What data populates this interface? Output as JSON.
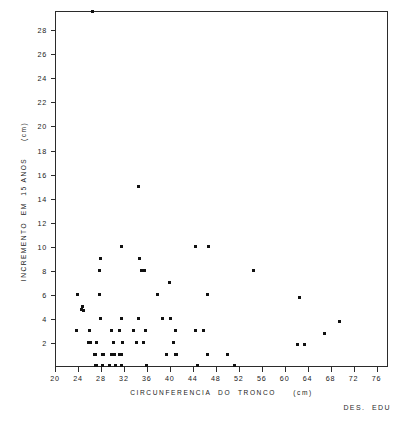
{
  "chart_data": {
    "type": "scatter",
    "title": "",
    "xlabel": "CIRCUNFERENCIA  DO  TRONCO     (cm)",
    "ylabel": "INCREMENTO  EM  15 ANOS     (cm)",
    "xlim": [
      20,
      78
    ],
    "ylim": [
      0,
      29.6
    ],
    "xticks": [
      20,
      24,
      28,
      32,
      36,
      40,
      44,
      48,
      52,
      56,
      60,
      64,
      68,
      72,
      76
    ],
    "yticks": [
      2,
      4,
      6,
      8,
      10,
      12,
      14,
      16,
      18,
      20,
      22,
      24,
      26,
      28
    ],
    "xtick_labels": [
      "20",
      "24",
      "28",
      "32",
      "36",
      "40",
      "44",
      "48",
      "52",
      "56",
      "60",
      "64",
      "68",
      "72",
      "76"
    ],
    "ytick_labels": [
      "2",
      "4",
      "6",
      "8",
      "10",
      "12",
      "14",
      "16",
      "18",
      "20",
      "22",
      "24",
      "26",
      "28"
    ],
    "grid": false,
    "legend": null,
    "marker": "square",
    "marker_color": "#111111",
    "frame_color": "#2b2b2b",
    "annotation": "DES.  EDU",
    "points": [
      [
        26.5,
        29.6
      ],
      [
        34.5,
        15.0
      ],
      [
        31.5,
        10.0
      ],
      [
        44.5,
        10.0
      ],
      [
        46.8,
        10.0
      ],
      [
        28.0,
        9.0
      ],
      [
        34.8,
        9.0
      ],
      [
        27.8,
        8.0
      ],
      [
        35.0,
        8.0
      ],
      [
        35.6,
        8.0
      ],
      [
        54.5,
        8.0
      ],
      [
        40.0,
        7.0
      ],
      [
        24.0,
        6.0
      ],
      [
        27.8,
        6.0
      ],
      [
        37.8,
        6.0
      ],
      [
        46.5,
        6.0
      ],
      [
        62.5,
        5.8
      ],
      [
        24.8,
        5.0
      ],
      [
        24.6,
        4.8
      ],
      [
        24.9,
        4.7
      ],
      [
        28.0,
        4.0
      ],
      [
        31.5,
        4.0
      ],
      [
        34.6,
        4.0
      ],
      [
        38.8,
        4.0
      ],
      [
        40.2,
        4.0
      ],
      [
        69.5,
        3.8
      ],
      [
        23.8,
        3.0
      ],
      [
        26.0,
        3.0
      ],
      [
        29.8,
        3.0
      ],
      [
        31.3,
        3.0
      ],
      [
        33.6,
        3.0
      ],
      [
        35.8,
        3.0
      ],
      [
        41.0,
        3.0
      ],
      [
        44.5,
        3.0
      ],
      [
        45.9,
        3.0
      ],
      [
        67.0,
        2.8
      ],
      [
        25.8,
        2.0
      ],
      [
        26.2,
        2.0
      ],
      [
        27.2,
        2.0
      ],
      [
        30.2,
        2.0
      ],
      [
        31.7,
        2.0
      ],
      [
        34.2,
        2.0
      ],
      [
        35.5,
        2.0
      ],
      [
        40.6,
        2.0
      ],
      [
        62.3,
        1.9
      ],
      [
        63.5,
        1.9
      ],
      [
        26.8,
        1.0
      ],
      [
        27.1,
        1.0
      ],
      [
        28.2,
        1.0
      ],
      [
        28.5,
        1.0
      ],
      [
        29.8,
        1.0
      ],
      [
        30.3,
        1.0
      ],
      [
        31.3,
        1.0
      ],
      [
        31.6,
        1.0
      ],
      [
        39.5,
        1.0
      ],
      [
        41.0,
        1.0
      ],
      [
        41.2,
        1.0
      ],
      [
        46.5,
        1.0
      ],
      [
        50.0,
        1.0
      ],
      [
        27.0,
        0.1
      ],
      [
        27.3,
        0.15
      ],
      [
        28.3,
        0.1
      ],
      [
        29.5,
        0.1
      ],
      [
        30.5,
        0.1
      ],
      [
        31.5,
        0.1
      ],
      [
        35.9,
        0.1
      ],
      [
        44.8,
        0.1
      ],
      [
        51.3,
        0.1
      ]
    ]
  },
  "figure": {
    "x_axis_title": "CIRCUNFERENCIA  DO  TRONCO     (cm)",
    "y_axis_title": "INCREMENTO  EM  15 ANOS     (cm)",
    "credit": "DES.  EDU"
  }
}
